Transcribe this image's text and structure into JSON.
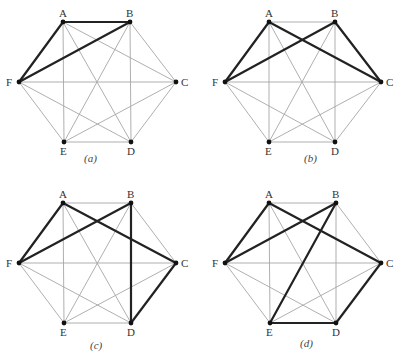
{
  "figure": {
    "vertices": [
      "A",
      "B",
      "C",
      "D",
      "E",
      "F"
    ],
    "colors": {
      "thin_edge": "#a6a6a6",
      "bold_edge": "#222222",
      "vertex": "#111111"
    },
    "panels": [
      {
        "id": "a",
        "caption": "(a)",
        "caption_pos": [
          84,
          162
        ],
        "coords": {
          "A": [
            63,
            22
          ],
          "B": [
            130,
            22
          ],
          "C": [
            176,
            82
          ],
          "D": [
            131,
            142
          ],
          "E": [
            64,
            142
          ],
          "F": [
            19,
            82
          ]
        },
        "bold_edges": [
          [
            "A",
            "B"
          ],
          [
            "A",
            "F"
          ],
          [
            "B",
            "F"
          ]
        ]
      },
      {
        "id": "b",
        "caption": "(b)",
        "caption_pos": [
          304,
          162
        ],
        "coords": {
          "A": [
            269,
            22
          ],
          "B": [
            335,
            22
          ],
          "C": [
            381,
            82
          ],
          "D": [
            335,
            142
          ],
          "E": [
            269,
            142
          ],
          "F": [
            225,
            82
          ]
        },
        "bold_edges": [
          [
            "A",
            "F"
          ],
          [
            "A",
            "C"
          ],
          [
            "B",
            "F"
          ],
          [
            "B",
            "C"
          ]
        ]
      },
      {
        "id": "c",
        "caption": "(c)",
        "caption_pos": [
          90,
          349
        ],
        "coords": {
          "A": [
            63,
            203
          ],
          "B": [
            131,
            203
          ],
          "C": [
            176,
            263
          ],
          "D": [
            131,
            323
          ],
          "E": [
            64,
            323
          ],
          "F": [
            19,
            263
          ]
        },
        "bold_edges": [
          [
            "A",
            "F"
          ],
          [
            "A",
            "C"
          ],
          [
            "B",
            "F"
          ],
          [
            "B",
            "D"
          ],
          [
            "C",
            "D"
          ]
        ]
      },
      {
        "id": "d",
        "caption": "(d)",
        "caption_pos": [
          300,
          347
        ],
        "coords": {
          "A": [
            269,
            203
          ],
          "B": [
            336,
            203
          ],
          "C": [
            381,
            263
          ],
          "D": [
            336,
            323
          ],
          "E": [
            270,
            323
          ],
          "F": [
            225,
            263
          ]
        },
        "bold_edges": [
          [
            "A",
            "F"
          ],
          [
            "A",
            "C"
          ],
          [
            "B",
            "F"
          ],
          [
            "B",
            "E"
          ],
          [
            "C",
            "D"
          ],
          [
            "D",
            "E"
          ]
        ]
      }
    ]
  }
}
